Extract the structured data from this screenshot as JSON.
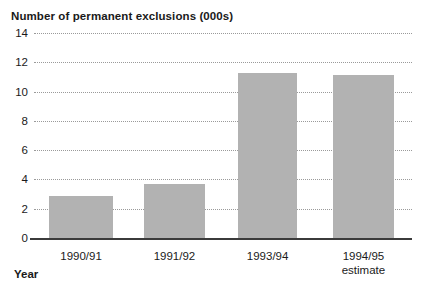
{
  "chart_data": {
    "type": "bar",
    "title": "Number of permanent exclusions (000s)",
    "xlabel": "Year",
    "ylabel": "",
    "categories": [
      "1990/91",
      "1991/92",
      "1993/94",
      "1994/95 estimate"
    ],
    "category_lines": [
      [
        "1990/91",
        ""
      ],
      [
        "1991/92",
        ""
      ],
      [
        "1993/94",
        ""
      ],
      [
        "1994/95",
        "estimate"
      ]
    ],
    "values": [
      2.9,
      3.7,
      11.3,
      11.1
    ],
    "ylim": [
      0,
      14
    ],
    "yticks": [
      0,
      2,
      4,
      6,
      8,
      10,
      12,
      14
    ],
    "ytick_labels": [
      "0",
      "2",
      "4",
      "6",
      "8",
      "10",
      "12",
      "14"
    ],
    "grid": true,
    "grid_style": "dotted",
    "legend": "none",
    "bar_color": "#b2b2b2",
    "axis_color": "#3b3b3b",
    "gridline_color": "#9a9a9a",
    "text_color": "#1a1a1a",
    "bar_positions": [
      {
        "left_pct": 4.0,
        "width_pct": 16.9
      },
      {
        "left_pct": 29.1,
        "width_pct": 16.1
      },
      {
        "left_pct": 54.0,
        "width_pct": 15.6
      },
      {
        "left_pct": 79.1,
        "width_pct": 16.1
      }
    ]
  }
}
